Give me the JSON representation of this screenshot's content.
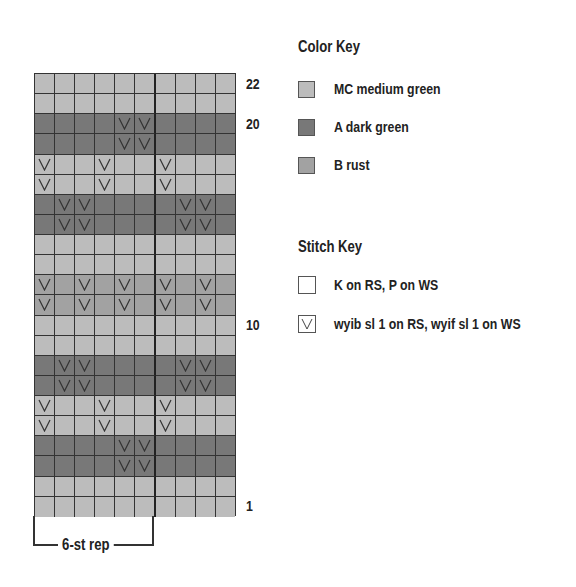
{
  "color_key": {
    "title": "Color Key",
    "items": [
      {
        "code": "MC",
        "label": "MC  medium green",
        "color": "#bcbcbc"
      },
      {
        "code": "A",
        "label": "A  dark green",
        "color": "#787878"
      },
      {
        "code": "B",
        "label": "B  rust",
        "color": "#a2a2a2"
      }
    ]
  },
  "stitch_key": {
    "title": "Stitch Key",
    "items": [
      {
        "symbol": "blank",
        "label": "K on RS, P on WS"
      },
      {
        "symbol": "v",
        "label": "wyib sl 1 on RS, wyif sl 1 on WS"
      }
    ]
  },
  "chart": {
    "columns": 10,
    "rows_count": 22,
    "repeat_label": "6-st rep",
    "row_labels": [
      {
        "row": 22,
        "text": "22"
      },
      {
        "row": 20,
        "text": "20"
      },
      {
        "row": 10,
        "text": "10"
      },
      {
        "row": 1,
        "text": "1"
      }
    ],
    "rows": [
      {
        "row": 22,
        "color": "MC",
        "slips": []
      },
      {
        "row": 21,
        "color": "MC",
        "slips": []
      },
      {
        "row": 20,
        "color": "A",
        "slips": [
          4,
          5
        ]
      },
      {
        "row": 19,
        "color": "A",
        "slips": [
          4,
          5
        ]
      },
      {
        "row": 18,
        "color": "MC",
        "slips": [
          0,
          3,
          6
        ]
      },
      {
        "row": 17,
        "color": "MC",
        "slips": [
          0,
          3,
          6
        ]
      },
      {
        "row": 16,
        "color": "A",
        "slips": [
          1,
          2,
          7,
          8
        ]
      },
      {
        "row": 15,
        "color": "A",
        "slips": [
          1,
          2,
          7,
          8
        ]
      },
      {
        "row": 14,
        "color": "MC",
        "slips": []
      },
      {
        "row": 13,
        "color": "MC",
        "slips": []
      },
      {
        "row": 12,
        "color": "B",
        "slips": [
          0,
          2,
          4,
          6,
          8
        ]
      },
      {
        "row": 11,
        "color": "B",
        "slips": [
          0,
          2,
          4,
          6,
          8
        ]
      },
      {
        "row": 10,
        "color": "MC",
        "slips": []
      },
      {
        "row": 9,
        "color": "MC",
        "slips": []
      },
      {
        "row": 8,
        "color": "A",
        "slips": [
          1,
          2,
          7,
          8
        ]
      },
      {
        "row": 7,
        "color": "A",
        "slips": [
          1,
          2,
          7,
          8
        ]
      },
      {
        "row": 6,
        "color": "MC",
        "slips": [
          0,
          3,
          6
        ]
      },
      {
        "row": 5,
        "color": "MC",
        "slips": [
          0,
          3,
          6
        ]
      },
      {
        "row": 4,
        "color": "A",
        "slips": [
          4,
          5
        ]
      },
      {
        "row": 3,
        "color": "A",
        "slips": [
          4,
          5
        ]
      },
      {
        "row": 2,
        "color": "MC",
        "slips": []
      },
      {
        "row": 1,
        "color": "MC",
        "slips": []
      }
    ]
  }
}
